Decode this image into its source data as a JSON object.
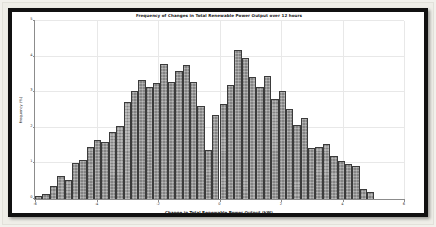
{
  "figure": {
    "frame_color": "#111111",
    "mat_color": "#efeee8",
    "canvas_color": "#ffffff"
  },
  "chart_data": {
    "type": "bar",
    "subtype": "histogram",
    "title": "Frequency of Changes in Total Renewable Power Output over 12 hours",
    "xlabel": "Change in Total Renewable Power Output (kW)",
    "ylabel": "Frequency (%)",
    "xlim": [
      -6,
      6
    ],
    "ylim": [
      0,
      5
    ],
    "xticks": [
      -6,
      -4,
      -2,
      0,
      2,
      4,
      6
    ],
    "xtick_labels": [
      "-6",
      "-4",
      "-2",
      "0",
      "2",
      "4",
      "6"
    ],
    "yticks": [
      0,
      1,
      2,
      3,
      4,
      5
    ],
    "ytick_labels": [
      "0",
      "1",
      "2",
      "3",
      "4",
      "5"
    ],
    "grid": true,
    "legend": null,
    "bar_color": "#848484",
    "bar_edge_color": "#3b3b3b",
    "bar_hatch": "dotted",
    "bin_width": 0.24,
    "bin_centers": [
      -5.88,
      -5.64,
      -5.4,
      -5.16,
      -4.92,
      -4.68,
      -4.44,
      -4.2,
      -3.96,
      -3.72,
      -3.48,
      -3.24,
      -3.0,
      -2.76,
      -2.52,
      -2.28,
      -2.04,
      -1.8,
      -1.56,
      -1.32,
      -1.08,
      -0.84,
      -0.6,
      -0.36,
      -0.12,
      0.12,
      0.36,
      0.6,
      0.84,
      1.08,
      1.32,
      1.56,
      1.8,
      2.04,
      2.28,
      2.52,
      2.76,
      3.0,
      3.24,
      3.48,
      3.72,
      3.96,
      4.2,
      4.44,
      4.68,
      4.92,
      5.16,
      5.4,
      5.64,
      5.88
    ],
    "values": [
      0.08,
      0.15,
      0.36,
      0.64,
      0.54,
      1.0,
      1.09,
      1.46,
      1.67,
      1.61,
      1.89,
      2.06,
      2.73,
      3.04,
      3.33,
      3.15,
      3.27,
      3.78,
      3.29,
      3.59,
      3.76,
      3.28,
      2.61,
      1.37,
      2.37,
      2.66,
      3.21,
      4.18,
      3.95,
      3.42,
      3.14,
      3.46,
      2.81,
      3.04,
      2.54,
      2.08,
      2.28,
      1.42,
      1.47,
      1.55,
      1.22,
      1.08,
      0.97,
      0.93,
      0.27,
      0.21,
      0.0,
      0.0,
      0.0,
      0.0
    ],
    "modes_approx": [
      -1.8,
      0.6
    ],
    "dip_center_approx": -0.36
  }
}
